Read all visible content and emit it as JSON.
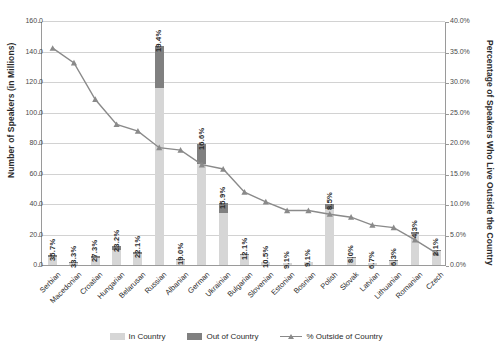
{
  "chart_data": {
    "type": "bar",
    "title": "",
    "xlabel": "",
    "ylabel": "Number of Speakers (in Millions)",
    "y2label": "Percentage of Speakers Who Live Outside the Country",
    "ylim": [
      0,
      160
    ],
    "y2lim": [
      0,
      40
    ],
    "grid": true,
    "legend_position": "bottom",
    "categories": [
      "Serbian",
      "Macedonian",
      "Croatian",
      "Hungarian",
      "Belarusan",
      "Russian",
      "Albanian",
      "German",
      "Ukrainian",
      "Bulgarian",
      "Slovenian",
      "Estonian",
      "Bosnian",
      "Polish",
      "Slovak",
      "Latvian",
      "Lithuanian",
      "Romanian",
      "Czech"
    ],
    "series": [
      {
        "name": "In Country",
        "values": [
          5.0,
          1.6,
          4.3,
          10.1,
          7.0,
          115.8,
          3.2,
          66.3,
          34.0,
          6.6,
          1.8,
          1.0,
          2.1,
          36.6,
          4.6,
          1.4,
          2.9,
          20.5,
          9.5
        ]
      },
      {
        "name": "Out of Country",
        "values": [
          1.8,
          0.6,
          1.5,
          2.5,
          1.6,
          27.9,
          0.7,
          13.2,
          6.4,
          0.9,
          0.2,
          0.1,
          0.2,
          3.4,
          0.4,
          0.1,
          0.2,
          0.9,
          0.2
        ]
      },
      {
        "name": "% Outside of Country",
        "values": [
          35.7,
          33.3,
          27.3,
          23.2,
          22.1,
          19.4,
          19.0,
          16.6,
          15.9,
          12.1,
          10.5,
          9.1,
          9.1,
          8.5,
          8.0,
          6.7,
          6.3,
          4.3,
          2.1
        ]
      }
    ],
    "data_labels": [
      "35.7%",
      "33.3%",
      "27.3%",
      "23.2%",
      "22.1%",
      "19.4%",
      "19.0%",
      "16.6%",
      "15.9%",
      "12.1%",
      "10.5%",
      "9.1%",
      "9.1%",
      "8.5%",
      "8.0%",
      "6.7%",
      "6.3%",
      "4.3%",
      "2.1%"
    ],
    "y_ticks": [
      "0.0",
      "20.0",
      "40.0",
      "60.0",
      "80.0",
      "100.0",
      "120.0",
      "140.0",
      "160.0"
    ],
    "y2_ticks": [
      "0.0%",
      "5.0%",
      "10.0%",
      "15.0%",
      "20.0%",
      "25.0%",
      "30.0%",
      "35.0%",
      "40.0%"
    ],
    "legend": [
      {
        "label": "In Country",
        "color": "#d6d6d6"
      },
      {
        "label": "Out of Country",
        "color": "#808080"
      },
      {
        "label": "% Outside of Country",
        "color": "#8a8a8a"
      }
    ]
  }
}
